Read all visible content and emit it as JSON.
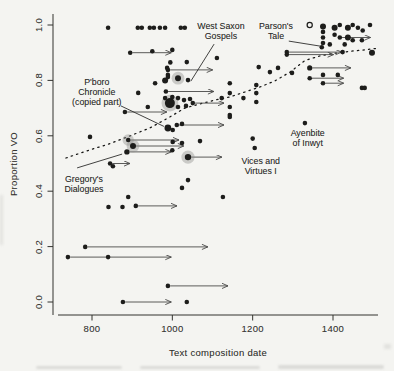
{
  "chart_data": {
    "type": "scatter",
    "xlabel": "Text composition date",
    "ylabel": "Proportion VO",
    "x_ticks": [
      800,
      1000,
      1200,
      1400
    ],
    "y_ticks": [
      "0.0",
      "0.2",
      "0.4",
      "0.6",
      "0.8",
      "1.0"
    ],
    "xlim": [
      715,
      1512
    ],
    "ylim": [
      0,
      1
    ],
    "grid": false,
    "legend": "none",
    "marker_note": "filled dark dots; horizontal arrows show date ranges; dotted line is smoothed trend",
    "points": [
      {
        "x": 840,
        "y": 0.99
      },
      {
        "x": 914,
        "y": 0.99
      },
      {
        "x": 924,
        "y": 0.99
      },
      {
        "x": 944,
        "y": 0.99
      },
      {
        "x": 954,
        "y": 0.99
      },
      {
        "x": 969,
        "y": 0.99
      },
      {
        "x": 982,
        "y": 0.99
      },
      {
        "x": 1021,
        "y": 0.99
      },
      {
        "x": 1031,
        "y": 0.99
      },
      {
        "x": 895,
        "y": 0.9,
        "end": 1000
      },
      {
        "x": 950,
        "y": 0.905
      },
      {
        "x": 1000,
        "y": 0.91
      },
      {
        "x": 987,
        "y": 0.845
      },
      {
        "x": 989,
        "y": 0.838,
        "end": 1103
      },
      {
        "x": 982,
        "y": 0.8,
        "r": 3
      },
      {
        "x": 989,
        "y": 0.82
      },
      {
        "x": 957,
        "y": 0.79
      },
      {
        "x": 915,
        "y": 0.755
      },
      {
        "x": 984,
        "y": 0.76,
        "end": 1106
      },
      {
        "x": 989,
        "y": 0.812
      },
      {
        "x": 1014,
        "y": 0.808,
        "r": 3,
        "halo": true
      },
      {
        "x": 1039,
        "y": 0.801
      },
      {
        "x": 995,
        "y": 0.865
      },
      {
        "x": 1036,
        "y": 0.866
      },
      {
        "x": 994,
        "y": 0.718,
        "r": 5,
        "halo": true
      },
      {
        "x": 982,
        "y": 0.736
      },
      {
        "x": 1000,
        "y": 0.74
      },
      {
        "x": 1014,
        "y": 0.736
      },
      {
        "x": 1029,
        "y": 0.729
      },
      {
        "x": 1044,
        "y": 0.733
      },
      {
        "x": 1051,
        "y": 0.718,
        "end": 1131
      },
      {
        "x": 1034,
        "y": 0.708
      },
      {
        "x": 1014,
        "y": 0.704
      },
      {
        "x": 939,
        "y": 0.704
      },
      {
        "x": 882,
        "y": 0.686,
        "end": 989
      },
      {
        "x": 989,
        "y": 0.628,
        "r": 3.4
      },
      {
        "x": 1001,
        "y": 0.621
      },
      {
        "x": 795,
        "y": 0.596
      },
      {
        "x": 1011,
        "y": 0.639,
        "end": 1131
      },
      {
        "x": 1024,
        "y": 0.643
      },
      {
        "x": 1001,
        "y": 0.578
      },
      {
        "x": 1024,
        "y": 0.574
      },
      {
        "x": 1069,
        "y": 0.581
      },
      {
        "x": 890,
        "y": 0.585,
        "halo": true,
        "end": 1019
      },
      {
        "x": 902,
        "y": 0.563,
        "r": 3,
        "halo": true,
        "end": 1031
      },
      {
        "x": 887,
        "y": 0.542,
        "r": 2.7,
        "end": 1000
      },
      {
        "x": 1000,
        "y": 0.548
      },
      {
        "x": 1039,
        "y": 0.523,
        "r": 3.2,
        "halo": true,
        "end": 1126
      },
      {
        "x": 845,
        "y": 0.5,
        "end": 897
      },
      {
        "x": 852,
        "y": 0.49
      },
      {
        "x": 1111,
        "y": 0.881
      },
      {
        "x": 1123,
        "y": 0.736
      },
      {
        "x": 1143,
        "y": 0.79
      },
      {
        "x": 1143,
        "y": 0.754
      },
      {
        "x": 1143,
        "y": 0.704
      },
      {
        "x": 1143,
        "y": 0.675
      },
      {
        "x": 1177,
        "y": 0.736
      },
      {
        "x": 1209,
        "y": 0.783
      },
      {
        "x": 1209,
        "y": 0.754
      },
      {
        "x": 1209,
        "y": 0.722
      },
      {
        "x": 1215,
        "y": 0.848
      },
      {
        "x": 1243,
        "y": 0.83
      },
      {
        "x": 1263,
        "y": 0.845
      },
      {
        "x": 1298,
        "y": 0.827
      },
      {
        "x": 1200,
        "y": 0.59
      },
      {
        "x": 1205,
        "y": 0.556
      },
      {
        "x": 1330,
        "y": 0.646
      },
      {
        "x": 1126,
        "y": 0.379
      },
      {
        "x": 890,
        "y": 0.379
      },
      {
        "x": 1024,
        "y": 0.412
      },
      {
        "x": 1039,
        "y": 0.44
      },
      {
        "x": 1143,
        "y": 0.668
      },
      {
        "x": 1342,
        "y": 1.0,
        "open": true
      },
      {
        "x": 1375,
        "y": 0.995,
        "r": 3
      },
      {
        "x": 1375,
        "y": 0.975
      },
      {
        "x": 1375,
        "y": 0.955
      },
      {
        "x": 1375,
        "y": 0.935
      },
      {
        "x": 1372,
        "y": 0.92
      },
      {
        "x": 1404,
        "y": 0.99,
        "r": 3
      },
      {
        "x": 1417,
        "y": 1.0
      },
      {
        "x": 1437,
        "y": 0.99,
        "r": 3
      },
      {
        "x": 1449,
        "y": 1.0
      },
      {
        "x": 1462,
        "y": 0.99
      },
      {
        "x": 1474,
        "y": 0.98
      },
      {
        "x": 1492,
        "y": 1.0
      },
      {
        "x": 1404,
        "y": 0.965
      },
      {
        "x": 1417,
        "y": 0.955,
        "end": 1496
      },
      {
        "x": 1437,
        "y": 0.955,
        "r": 3
      },
      {
        "x": 1449,
        "y": 0.945
      },
      {
        "x": 1472,
        "y": 0.945
      },
      {
        "x": 1392,
        "y": 0.93
      },
      {
        "x": 1429,
        "y": 0.93
      },
      {
        "x": 1285,
        "y": 0.902,
        "end": 1424
      },
      {
        "x": 1285,
        "y": 0.893,
        "end": 1404
      },
      {
        "x": 1424,
        "y": 0.902
      },
      {
        "x": 1497,
        "y": 0.9,
        "r": 3
      },
      {
        "x": 1342,
        "y": 0.845,
        "end": 1447,
        "r": 2.6
      },
      {
        "x": 1375,
        "y": 0.82
      },
      {
        "x": 1412,
        "y": 0.82
      },
      {
        "x": 1375,
        "y": 0.79,
        "end": 1429
      },
      {
        "x": 1342,
        "y": 0.808,
        "end": 1429
      },
      {
        "x": 1472,
        "y": 0.773
      },
      {
        "x": 1479,
        "y": 0.773
      },
      {
        "x": 841,
        "y": 0.343
      },
      {
        "x": 876,
        "y": 0.343
      },
      {
        "x": 909,
        "y": 0.347,
        "end": 1014
      },
      {
        "x": 783,
        "y": 0.199,
        "end": 1091
      },
      {
        "x": 740,
        "y": 0.162,
        "end": 1000
      },
      {
        "x": 840,
        "y": 0.162
      },
      {
        "x": 989,
        "y": 0.058,
        "end": 1141
      },
      {
        "x": 877,
        "y": 0.0,
        "end": 1000
      },
      {
        "x": 1036,
        "y": 0.0
      }
    ],
    "trend": {
      "style": "dotted",
      "points": [
        [
          735,
          0.52
        ],
        [
          795,
          0.549
        ],
        [
          845,
          0.572
        ],
        [
          895,
          0.6
        ],
        [
          944,
          0.628
        ],
        [
          989,
          0.664
        ],
        [
          1031,
          0.7
        ],
        [
          1069,
          0.715
        ],
        [
          1106,
          0.729
        ],
        [
          1143,
          0.74
        ],
        [
          1181,
          0.758
        ],
        [
          1218,
          0.776
        ],
        [
          1255,
          0.798
        ],
        [
          1293,
          0.83
        ],
        [
          1330,
          0.872
        ],
        [
          1367,
          0.888
        ],
        [
          1404,
          0.898
        ],
        [
          1442,
          0.905
        ],
        [
          1479,
          0.91
        ],
        [
          1510,
          0.916
        ]
      ]
    },
    "annotations": [
      {
        "id": "west-saxon-gospels",
        "lines": [
          "West Saxon",
          "Gospels"
        ],
        "cx": 1121,
        "cy": 0.975,
        "leader": {
          "x1": 1104,
          "y1": 0.931,
          "x2": 1046,
          "y2": 0.797
        }
      },
      {
        "id": "parsons-tale",
        "lines": [
          "Parson's",
          "Tale"
        ],
        "cx": 1258,
        "cy": 0.975,
        "leader": {
          "x1": 1290,
          "y1": 0.942,
          "x2": 1368,
          "y2": 0.924
        }
      },
      {
        "id": "pboro-chronicle",
        "lines": [
          "P'boro",
          "Chronicle",
          "(copied part)"
        ],
        "cx": 812,
        "cy": 0.754,
        "leader": {
          "x1": 872,
          "y1": 0.708,
          "x2": 979,
          "y2": 0.634
        }
      },
      {
        "id": "gregorys-dialogues",
        "lines": [
          "Gregory's",
          "Dialogues"
        ],
        "cx": 780,
        "cy": 0.422,
        "leader": {
          "x1": 763,
          "y1": 0.484,
          "x2": 875,
          "y2": 0.534
        }
      },
      {
        "id": "vices-and-virtues-i",
        "lines": [
          "Vices and",
          "Virtues I"
        ],
        "cx": 1220,
        "cy": 0.487
      },
      {
        "id": "ayenbite-of-inwyt",
        "lines": [
          "Ayenbite",
          "of Inwyt"
        ],
        "cx": 1337,
        "cy": 0.588
      }
    ]
  },
  "colors": {
    "background": "#f4f4f1",
    "point": "#1d1d1b",
    "halo": "#8f8f8c",
    "arrow": "#4a4a48",
    "trend": "#161614",
    "axis": "#33332f",
    "text": "#2e2e2c"
  },
  "scan_artifacts": {
    "cropped_caption_line_at_bottom": true
  }
}
